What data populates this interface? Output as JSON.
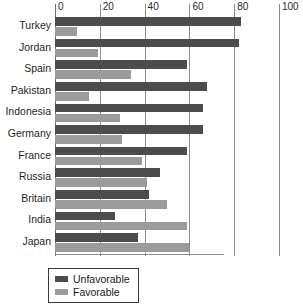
{
  "chart_data": {
    "type": "bar",
    "orientation": "horizontal",
    "title": "",
    "subtitle": "",
    "xlabel": "",
    "ylabel": "",
    "xlim": [
      0,
      100
    ],
    "xticks": [
      0,
      20,
      40,
      60,
      80,
      100
    ],
    "xtick_labels": [
      "0",
      "20",
      "40",
      "60",
      "80",
      "100"
    ],
    "grid": true,
    "grid_axis": "x",
    "legend_position": "bottom-left",
    "categories": [
      "Turkey",
      "Jordan",
      "Spain",
      "Pakistan",
      "Indonesia",
      "Germany",
      "France",
      "Russia",
      "Britain",
      "India",
      "Japan"
    ],
    "series": [
      {
        "name": "Unfavorable",
        "color": "#4c4c4c",
        "values": [
          83,
          82,
          59,
          68,
          66,
          66,
          59,
          47,
          42,
          27,
          37
        ]
      },
      {
        "name": "Favorable",
        "color": "#9b9b9b",
        "values": [
          10,
          19,
          34,
          15,
          29,
          30,
          39,
          41,
          50,
          59,
          60
        ]
      }
    ]
  },
  "legend": {
    "items": [
      {
        "label": "Unfavorable",
        "swatch": "unfav"
      },
      {
        "label": "Favorable",
        "swatch": "fav"
      }
    ]
  }
}
